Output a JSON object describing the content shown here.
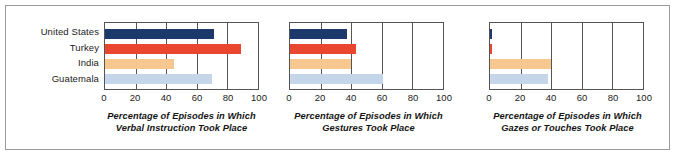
{
  "figure": {
    "categories": [
      "United States",
      "Turkey",
      "India",
      "Guatemala"
    ],
    "series_colors": {
      "United States": "#1b3a6b",
      "Turkey": "#e8462f",
      "India": "#f6c890",
      "Guatemala": "#c6d6ea"
    },
    "tick_labels": [
      "0",
      "20",
      "40",
      "60",
      "80",
      "100"
    ]
  },
  "chart_data": [
    {
      "type": "bar",
      "orientation": "horizontal",
      "title": "",
      "xlabel": "Percentage of Episodes in Which Verbal Instruction Took Place",
      "xlabel_line1": "Percentage of Episodes in Which",
      "xlabel_line2": "Verbal Instruction Took Place",
      "ylabel": "",
      "categories": [
        "United States",
        "Turkey",
        "India",
        "Guatemala"
      ],
      "values": [
        71,
        89,
        45,
        70
      ],
      "xlim": [
        0,
        100
      ],
      "xticks": [
        0,
        20,
        40,
        60,
        80,
        100
      ],
      "grid": true,
      "legend": "none"
    },
    {
      "type": "bar",
      "orientation": "horizontal",
      "title": "",
      "xlabel": "Percentage of Episodes in Which Gestures Took Place",
      "xlabel_line1": "Percentage of Episodes in Which",
      "xlabel_line2": "Gestures Took Place",
      "ylabel": "",
      "categories": [
        "United States",
        "Turkey",
        "India",
        "Guatemala"
      ],
      "values": [
        37,
        43,
        40,
        61
      ],
      "xlim": [
        0,
        100
      ],
      "xticks": [
        0,
        20,
        40,
        60,
        80,
        100
      ],
      "grid": true,
      "legend": "none"
    },
    {
      "type": "bar",
      "orientation": "horizontal",
      "title": "",
      "xlabel": "Percentage of Episodes in Which Gazes or Touches Took Place",
      "xlabel_line1": "Percentage of Episodes in Which",
      "xlabel_line2": "Gazes or Touches Took Place",
      "ylabel": "",
      "categories": [
        "United States",
        "Turkey",
        "India",
        "Guatemala"
      ],
      "values": [
        1,
        1,
        40,
        38
      ],
      "xlim": [
        0,
        100
      ],
      "xticks": [
        0,
        20,
        40,
        60,
        80,
        100
      ],
      "grid": true,
      "legend": "none"
    }
  ]
}
